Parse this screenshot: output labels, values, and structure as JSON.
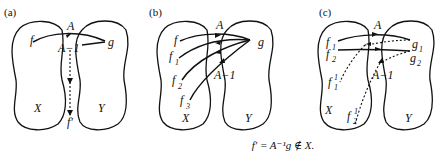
{
  "panels": [
    {
      "id": "a",
      "label": "(a)",
      "set_left": "X",
      "set_right": "Y",
      "points": {
        "f": "f",
        "g": "g",
        "f_prime": "f'"
      },
      "arrows": {
        "forward": "A",
        "inverse": "A−1"
      }
    },
    {
      "id": "b",
      "label": "(b)",
      "set_left": "X",
      "set_right": "Y",
      "points": {
        "f": "f",
        "f1": "f",
        "f1_sub": "1",
        "f2": "f",
        "f2_sub": "2",
        "f3": "f",
        "f3_sub": "3",
        "g": "g"
      },
      "arrows": {
        "forward": "A",
        "inverse": "A−1"
      }
    },
    {
      "id": "c",
      "label": "(c)",
      "set_left": "X",
      "set_right": "Y",
      "points": {
        "f1": "f",
        "f1_sub": "1",
        "f2": "f",
        "f2_sub": "2",
        "f1p": "f",
        "f1p_sub": "1",
        "f1p_sup": "1",
        "f2p": "f",
        "f2p_sub": "2",
        "f2p_sup": "1",
        "g1": "g",
        "g1_sub": "1",
        "g2": "g",
        "g2_sub": "2"
      },
      "arrows": {
        "forward": "A",
        "inverse": "A−1"
      }
    }
  ],
  "caption": "f′ = A⁻¹g ∉ X."
}
